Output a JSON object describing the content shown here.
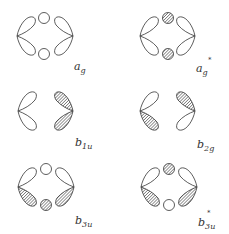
{
  "diagram": {
    "type": "molecular-orbital-symmetry",
    "orbitals": [
      {
        "id": "ag",
        "label": "a",
        "subscript": "g",
        "star": "",
        "lobes": {
          "left_up": "open",
          "left_down": "open",
          "right_up": "open",
          "right_down": "open"
        },
        "circles": {
          "top": "open",
          "bottom": "open"
        }
      },
      {
        "id": "ag_star",
        "label": "a",
        "subscript": "g",
        "star": "*",
        "lobes": {
          "left_up": "open",
          "left_down": "open",
          "right_up": "open",
          "right_down": "open"
        },
        "circles": {
          "top": "hatched",
          "bottom": "hatched"
        }
      },
      {
        "id": "b1u",
        "label": "b",
        "subscript": "1u",
        "star": "",
        "lobes": {
          "left_up": "open",
          "left_down": "open",
          "right_up": "hatched",
          "right_down": "hatched"
        },
        "circles": {}
      },
      {
        "id": "b2g",
        "label": "b",
        "subscript": "2g",
        "star": "",
        "lobes": {
          "left_up": "open",
          "left_down": "hatched",
          "right_up": "hatched",
          "right_down": "open"
        },
        "circles": {}
      },
      {
        "id": "b3u",
        "label": "b",
        "subscript": "3u",
        "star": "",
        "lobes": {
          "left_up": "open",
          "left_down": "hatched",
          "right_up": "open",
          "right_down": "hatched"
        },
        "circles": {
          "top": "open",
          "bottom": "hatched"
        }
      },
      {
        "id": "b3u_star",
        "label": "b",
        "subscript": "3u",
        "star": "*",
        "lobes": {
          "left_up": "open",
          "left_down": "hatched",
          "right_up": "open",
          "right_down": "hatched"
        },
        "circles": {
          "top": "hatched",
          "bottom": "open"
        }
      }
    ]
  },
  "labels": {
    "ag": {
      "main": "a",
      "sub": "g",
      "star": ""
    },
    "ag_star": {
      "main": "a",
      "sub": "g",
      "star": "*"
    },
    "b1u": {
      "main": "b",
      "sub": "1u",
      "star": ""
    },
    "b2g": {
      "main": "b",
      "sub": "2g",
      "star": ""
    },
    "b3u": {
      "main": "b",
      "sub": "3u",
      "star": ""
    },
    "b3u_star": {
      "main": "b",
      "sub": "3u",
      "star": "*"
    }
  }
}
